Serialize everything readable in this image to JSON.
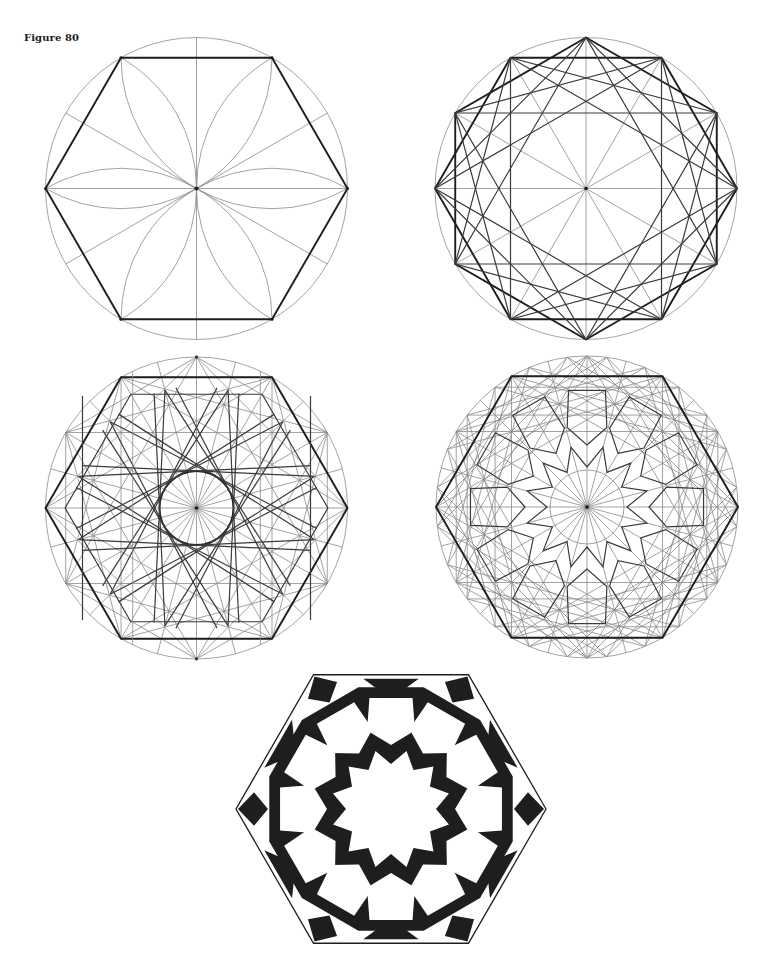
{
  "figure": {
    "label": "Figure 80",
    "panels": [
      {
        "id": "panel-1",
        "description": "Hexagon inscribed in circle with six lens petals and radial construction lines"
      },
      {
        "id": "panel-2",
        "description": "Twelve-point division with overlapping hexagons, squares and triangles"
      },
      {
        "id": "panel-3",
        "description": "Twelve-point star construction tangent to inner circle within hexagon grid"
      },
      {
        "id": "panel-4",
        "description": "Full construction grid with interlaced twelve-fold pattern lines"
      },
      {
        "id": "panel-5",
        "description": "Completed black and white hexagonal tile with twelve-pointed central star"
      }
    ]
  },
  "colors": {
    "ink": "#1e1e1e",
    "construction": "#8a8a8a",
    "paper": "#ffffff"
  }
}
